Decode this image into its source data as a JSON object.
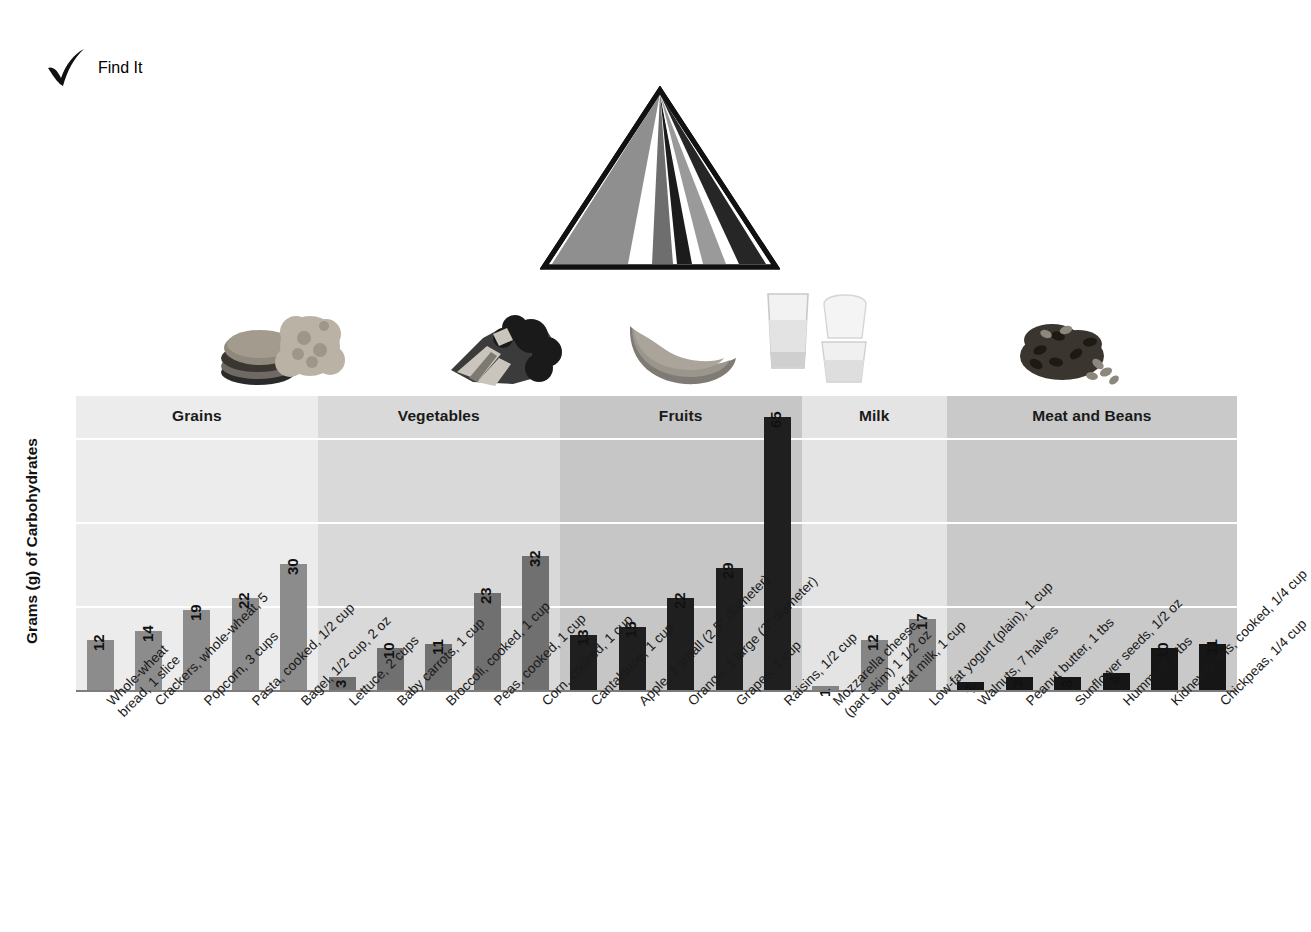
{
  "header": {
    "title": "Find It",
    "check_icon": "check-icon"
  },
  "pyramid": {
    "name": "food-guide-pyramid",
    "bands": [
      {
        "label": "Grains",
        "color": "#8f8f8f"
      },
      {
        "label": "Vegetables",
        "color": "#6e6e6e"
      },
      {
        "label": "Fruits",
        "color": "#1c1c1c"
      },
      {
        "label": "Oils",
        "color": "#b5b5b5"
      },
      {
        "label": "Milk",
        "color": "#9a9a9a"
      },
      {
        "label": "Meat and Beans",
        "color": "#262626"
      }
    ]
  },
  "photos": [
    {
      "name": "grains-photo",
      "alt": "bread-and-cereal"
    },
    {
      "name": "vegetables-photo",
      "alt": "broccoli"
    },
    {
      "name": "fruits-photo",
      "alt": "cantaloupe-slice"
    },
    {
      "name": "milk-photo",
      "alt": "milk-glasses"
    },
    {
      "name": "meat-beans-photo",
      "alt": "beans"
    }
  ],
  "chart_data": {
    "type": "bar",
    "title": "",
    "xlabel": "",
    "ylabel": "Grams (g) of Carbohydrates",
    "ylim": [
      0,
      70
    ],
    "grid": true,
    "gridlines": [
      20,
      40,
      60
    ],
    "legend": "none",
    "categories": [
      "Whole-wheat\nbread, 1 slice",
      "Crackers, whole-wheat, 5",
      "Popcorn, 3 cups",
      "Pasta, cooked, 1/2 cup",
      "Bagel, 1/2 cup, 2 oz",
      "Lettuce, 2 cups",
      "Baby carrots, 1 cup",
      "Broccoli, cooked, 1 cup",
      "Peas, cooked, 1 cup",
      "Corn, cooked, 1 cup",
      "Cantaloupe, 1 cup",
      "Apple, 1 small (2.5\" diameter)",
      "Orange, 1 large (3\" diameter)",
      "Grapes, 1 cup",
      "Raisins, 1/2 cup",
      "Mozzarella cheese\n(part skim) 1 1/2 oz",
      "Low-fat milk, 1 cup",
      "Low-fat yogurt (plain), 1 cup",
      "Walnuts, 7 halves",
      "Peanut butter, 1 tbs",
      "Sunflower seeds, 1/2 oz",
      "Hummus, 2 tbs",
      "Kidney beans, cooked, 1/4 cup",
      "Chickpeas, 1/4 cup"
    ],
    "values": [
      12,
      14,
      19,
      22,
      30,
      3,
      10,
      11,
      23,
      32,
      13,
      15,
      22,
      29,
      65,
      1,
      12,
      17,
      2,
      3,
      3,
      4,
      10,
      11
    ],
    "groups": [
      {
        "label": "Grains",
        "start": 0,
        "count": 5,
        "band_color": "#ececec",
        "bar_color": "#8c8c8c"
      },
      {
        "label": "Vegetables",
        "start": 5,
        "count": 5,
        "band_color": "#d9d9d9",
        "bar_color": "#707070"
      },
      {
        "label": "Fruits",
        "start": 10,
        "count": 5,
        "band_color": "#c6c6c6",
        "bar_color": "#1f1f1f"
      },
      {
        "label": "Milk",
        "start": 15,
        "count": 3,
        "band_color": "#e4e4e4",
        "bar_color": "#858585"
      },
      {
        "label": "Meat and Beans",
        "start": 18,
        "count": 6,
        "band_color": "#c9c9c9",
        "bar_color": "#161616"
      }
    ]
  }
}
